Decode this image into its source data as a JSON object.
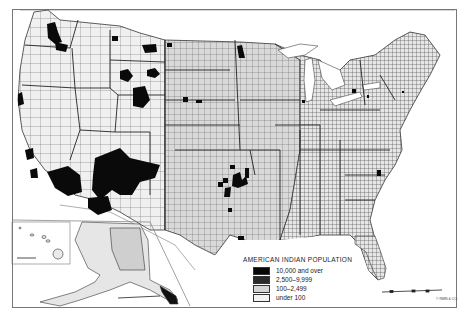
{
  "map": {
    "title": "AMERICAN INDIAN POPULATION",
    "top_caption_cutoff": "",
    "region": "United States by county (with Alaska and Hawaii insets)",
    "colors": {
      "background": "#ffffff",
      "ocean": "#ffffff",
      "land_under_100": "#f2f2f2",
      "land_100_2499": "#d4d4d4",
      "class_2500_9999": "#2a2a2a",
      "class_10000_over": "#080808",
      "county_lines": "#444444",
      "frame": "#777777"
    },
    "insets": [
      {
        "name": "Hawaii",
        "has_scale_bar": true
      },
      {
        "name": "Alaska",
        "has_scale_bar": true
      }
    ],
    "scale_bar": {
      "present": true,
      "location": "bottom-right"
    },
    "credit": "© RMN & CO."
  },
  "legend": {
    "title": "AMERICAN INDIAN POPULATION",
    "items": [
      {
        "label": "10,000 and over",
        "color": "#080808"
      },
      {
        "label": "2,500–9,999",
        "color": "#2a2a2a"
      },
      {
        "label": "100–2,499",
        "color": "#d4d4d4"
      },
      {
        "label": "under 100",
        "color": "#f2f2f2"
      }
    ]
  }
}
